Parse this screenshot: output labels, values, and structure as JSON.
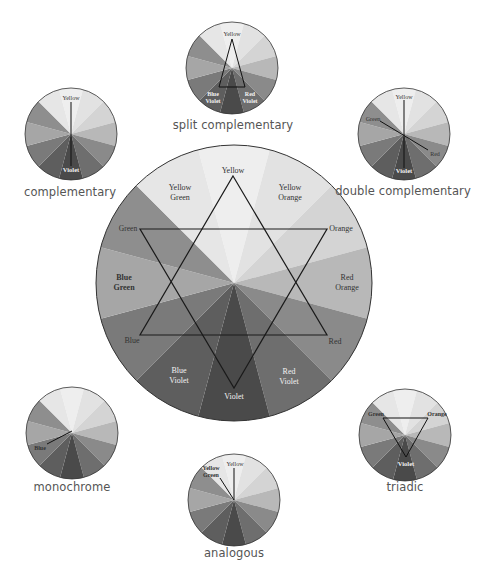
{
  "colors": {
    "wedges": [
      "#eeeeee",
      "#e2e2e2",
      "#d6d6d6",
      "#c8c8c8",
      "#b4b4b4",
      "#9c9c9c",
      "#7e7e7e",
      "#545454",
      "#474747",
      "#6a6a6a",
      "#8e8e8e",
      "#a8a8a8"
    ],
    "outline": "#222222",
    "background": "#ffffff"
  },
  "main_wheel": {
    "center": [
      234,
      283
    ],
    "radius": 138,
    "labels": {
      "yellow": "Yellow",
      "yellow_orange_1": "Yellow",
      "yellow_orange_2": "Orange",
      "orange": "Orange",
      "red_orange_1": "Red",
      "red_orange_2": "Orange",
      "red": "Red",
      "red_violet_1": "Red",
      "red_violet_2": "Violet",
      "violet": "Violet",
      "blue_violet_1": "Blue",
      "blue_violet_2": "Violet",
      "blue": "Blue",
      "blue_green_1": "Blue",
      "blue_green_2": "Green",
      "green": "Green",
      "yellow_green_1": "Yellow",
      "yellow_green_2": "Green"
    }
  },
  "schemes": {
    "split_complementary": {
      "title": "split complementary",
      "labels": [
        "Yellow",
        "Blue",
        "Violet",
        "Red",
        "Violet"
      ]
    },
    "complementary": {
      "title": "complementary",
      "labels": [
        "Yellow",
        "Violet"
      ]
    },
    "double_complementary": {
      "title": "double complementary",
      "labels": [
        "Yellow",
        "Green",
        "Red",
        "Violet"
      ]
    },
    "monochrome": {
      "title": "monochrome",
      "labels": [
        "Blue"
      ]
    },
    "analogous": {
      "title": "analogous",
      "labels": [
        "Yellow",
        "Yellow",
        "Green"
      ]
    },
    "triadic": {
      "title": "triadic",
      "labels": [
        "Green",
        "Orange",
        "Violet"
      ]
    }
  }
}
